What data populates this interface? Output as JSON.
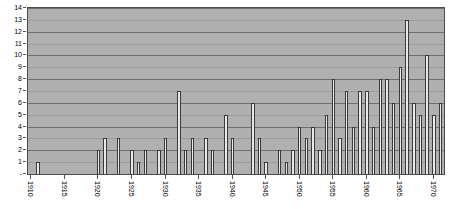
{
  "chart_data": {
    "type": "bar",
    "title": "",
    "subtitle": "",
    "xlabel": "",
    "ylabel": "",
    "ylim": [
      0,
      14
    ],
    "xlim": [
      1910,
      1971
    ],
    "grid": true,
    "legend": null,
    "y_ticks": [
      0,
      1,
      2,
      3,
      4,
      5,
      6,
      7,
      8,
      9,
      10,
      11,
      12,
      13,
      14
    ],
    "y_tick_labels": [
      "-",
      "1",
      "2",
      "3",
      "4",
      "5",
      "6",
      "7",
      "8",
      "9",
      "10",
      "11",
      "12",
      "13",
      "14"
    ],
    "x_tick_labels": [
      "1910",
      "1915",
      "1920",
      "1925",
      "1930",
      "1935",
      "1940",
      "1945",
      "1950",
      "1955",
      "1960",
      "1965",
      "1970"
    ],
    "x_tick_values": [
      1910,
      1915,
      1920,
      1925,
      1930,
      1935,
      1940,
      1945,
      1950,
      1955,
      1960,
      1965,
      1970
    ],
    "categories": [
      "1910",
      "1911",
      "1912",
      "1913",
      "1914",
      "1915",
      "1916",
      "1917",
      "1918",
      "1919",
      "1920",
      "1921",
      "1922",
      "1923",
      "1924",
      "1925",
      "1926",
      "1927",
      "1928",
      "1929",
      "1930",
      "1931",
      "1932",
      "1933",
      "1934",
      "1935",
      "1936",
      "1937",
      "1938",
      "1939",
      "1940",
      "1941",
      "1942",
      "1943",
      "1944",
      "1945",
      "1946",
      "1947",
      "1948",
      "1949",
      "1950",
      "1951",
      "1952",
      "1953",
      "1954",
      "1955",
      "1956",
      "1957",
      "1958",
      "1959",
      "1960",
      "1961",
      "1962",
      "1963",
      "1964",
      "1965",
      "1966",
      "1967",
      "1968",
      "1969",
      "1970",
      "1971"
    ],
    "values": [
      0,
      1,
      0,
      0,
      0,
      0,
      0,
      0,
      0,
      0,
      2,
      3,
      0,
      3,
      0,
      2,
      1,
      2,
      0,
      2,
      3,
      0,
      7,
      2,
      3,
      0,
      3,
      2,
      0,
      5,
      3,
      0,
      0,
      6,
      3,
      1,
      0,
      2,
      1,
      2,
      4,
      3,
      4,
      2,
      5,
      8,
      3,
      7,
      4,
      7,
      7,
      4,
      8,
      8,
      6,
      9,
      13,
      6,
      5,
      10,
      5,
      6
    ],
    "colors": {
      "plot_background": "#b0b0b0",
      "page_background": "#ffffff",
      "bar_fill": "#e9e9e9",
      "bar_edge": "#3a3a3a",
      "gridline": "#6e6e6e",
      "axis": "#4a4a4a",
      "text": "#000000"
    }
  }
}
